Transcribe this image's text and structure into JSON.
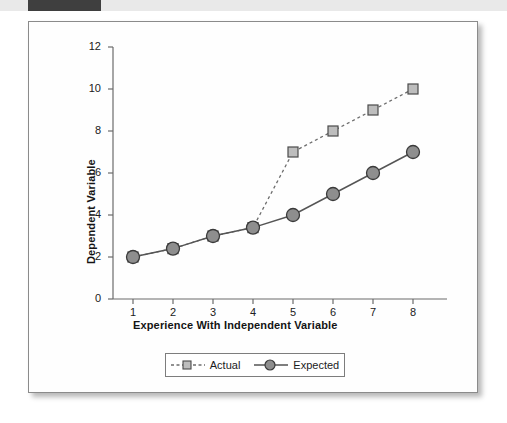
{
  "figure": {
    "band_label": "",
    "frame_name": "chart-figure"
  },
  "chart_data": {
    "type": "line",
    "title": "",
    "xlabel": "Experience With Independent Variable",
    "ylabel": "Dependent Variable",
    "x": [
      1,
      2,
      3,
      4,
      5,
      6,
      7,
      8
    ],
    "xticks": [
      "1",
      "2",
      "3",
      "4",
      "5",
      "6",
      "7",
      "8"
    ],
    "yticks": [
      "0",
      "2",
      "4",
      "6",
      "8",
      "10",
      "12"
    ],
    "ylim": [
      0,
      12
    ],
    "xlim": [
      0.5,
      8.5
    ],
    "grid": false,
    "legend_position": "bottom-center",
    "series": [
      {
        "name": "Actual",
        "values": [
          2,
          2.4,
          3,
          3.4,
          7,
          8,
          9,
          10
        ],
        "marker": "square",
        "linestyle": "dashed",
        "line_color": "#6d6d6d",
        "marker_fill": "#bdbdbd",
        "marker_edge": "#4a4a4a"
      },
      {
        "name": "Expected",
        "values": [
          2,
          2.4,
          3,
          3.4,
          4,
          5,
          6,
          7
        ],
        "marker": "circle",
        "linestyle": "solid",
        "line_color": "#555555",
        "marker_fill": "#8e8e8e",
        "marker_edge": "#3a3a3a"
      }
    ]
  },
  "legend": {
    "entries": [
      {
        "label": "Actual"
      },
      {
        "label": "Expected"
      }
    ]
  },
  "colors": {
    "axis": "#6b6b6b",
    "text": "#141414",
    "band_dark": "#3f3f3f",
    "band_light": "#e9e9e9",
    "frame_border": "#8b8b8b"
  }
}
